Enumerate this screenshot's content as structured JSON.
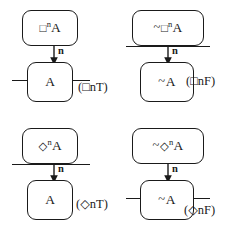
{
  "diagram": {
    "ink_color": "#1a1a1a",
    "background_color": "#ffffff",
    "rules": [
      {
        "id": "box-n-true",
        "name": "(□ⁿT)",
        "premise": "□ⁿA",
        "premise_parts": {
          "tilde": "",
          "op": "□",
          "sup": "n",
          "arg": "A"
        },
        "conclusion": "A",
        "conclusion_parts": {
          "tilde": "",
          "arg": "A"
        },
        "arrow_label": "n",
        "bar_position": "bottom"
      },
      {
        "id": "box-n-false",
        "name": "(□ⁿF)",
        "premise": "~□ⁿA",
        "premise_parts": {
          "tilde": "~",
          "op": "□",
          "sup": "n",
          "arg": "A"
        },
        "conclusion": "~A",
        "conclusion_parts": {
          "tilde": "~",
          "arg": "A"
        },
        "arrow_label": "n",
        "bar_position": "top"
      },
      {
        "id": "diamond-n-true",
        "name": "(◇ⁿT)",
        "premise": "◇ⁿA",
        "premise_parts": {
          "tilde": "",
          "op": "◇",
          "sup": "n",
          "arg": "A"
        },
        "conclusion": "A",
        "conclusion_parts": {
          "tilde": "",
          "arg": "A"
        },
        "arrow_label": "n",
        "bar_position": "top"
      },
      {
        "id": "diamond-n-false",
        "name": "(◇ⁿF)",
        "premise": "~◇ⁿA",
        "premise_parts": {
          "tilde": "~",
          "op": "◇",
          "sup": "n",
          "arg": "A"
        },
        "conclusion": "~A",
        "conclusion_parts": {
          "tilde": "~",
          "arg": "A"
        },
        "arrow_label": "n",
        "bar_position": "bottom"
      }
    ]
  }
}
